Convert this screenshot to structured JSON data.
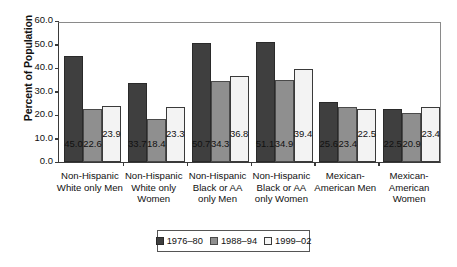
{
  "chart_data": {
    "type": "bar",
    "title": "",
    "xlabel": "",
    "ylabel": "Percent of Population",
    "ylim": [
      0.0,
      60.0
    ],
    "ytick_labels": [
      "0.0",
      "10.0",
      "20.0",
      "30.0",
      "40.0",
      "50.0",
      "60.0"
    ],
    "ytick_values": [
      0,
      10,
      20,
      30,
      40,
      50,
      60
    ],
    "grid": false,
    "legend_position": "bottom-center",
    "categories": [
      "Non-Hispanic White only Men",
      "Non-Hispanic White only Women",
      "Non-Hispanic Black or AA only Men",
      "Non-Hispanic Black or AA only Women",
      "Mexican-American Men",
      "Mexican-American Women"
    ],
    "category_lines": [
      [
        "Non-Hispanic",
        "White only Men"
      ],
      [
        "Non-Hispanic",
        "White only",
        "Women"
      ],
      [
        "Non-Hispanic",
        "Black or AA",
        "only Men"
      ],
      [
        "Non-Hispanic",
        "Black or AA",
        "only Women"
      ],
      [
        "Mexican-",
        "American  Men"
      ],
      [
        "Mexican-",
        "American",
        "Women"
      ]
    ],
    "series": [
      {
        "name": "1976–80",
        "color": "#3f3f3f",
        "values": [
          45.0,
          33.7,
          50.7,
          51.1,
          25.6,
          22.5
        ]
      },
      {
        "name": "1988–94",
        "color": "#8f8f8f",
        "values": [
          22.6,
          18.4,
          34.3,
          34.9,
          23.4,
          20.9
        ]
      },
      {
        "name": "1999–02",
        "color": "#f3f3f3",
        "values": [
          23.9,
          23.3,
          36.8,
          39.4,
          22.5,
          23.4
        ]
      }
    ],
    "data_labels": [
      [
        "45.0",
        "22.6",
        "23.9"
      ],
      [
        "33.7",
        "18.4",
        "23.3"
      ],
      [
        "50.7",
        "34.3",
        "36.8"
      ],
      [
        "51.1",
        "34.9",
        "39.4"
      ],
      [
        "25.6",
        "23.4",
        "22.5"
      ],
      [
        "22.5",
        "20.9",
        "23.4"
      ]
    ]
  },
  "legend": {
    "items": [
      {
        "label": "1976–80"
      },
      {
        "label": "1988–94"
      },
      {
        "label": "1999–02"
      }
    ]
  }
}
